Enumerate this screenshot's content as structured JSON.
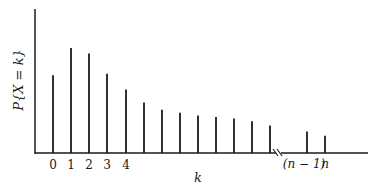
{
  "chart_data": {
    "type": "bar",
    "subtype": "stem",
    "title": "",
    "xlabel": "k",
    "ylabel": "P{X = k}",
    "categories": [
      "0",
      "1",
      "2",
      "3",
      "4",
      "5",
      "6",
      "7",
      "8",
      "9",
      "10",
      "11",
      "12",
      "(n − 1)",
      "n"
    ],
    "tick_labels_shown": [
      "0",
      "1",
      "2",
      "3",
      "4",
      "(n − 1)",
      "n"
    ],
    "values": [
      0.54,
      0.73,
      0.69,
      0.55,
      0.44,
      0.35,
      0.3,
      0.28,
      0.26,
      0.25,
      0.24,
      0.22,
      0.19,
      0.15,
      0.12
    ],
    "axis_break_after": "12",
    "yticks": "none",
    "grid": false,
    "legend": null,
    "ylim": [
      0,
      1
    ]
  },
  "labels": {
    "xlabel": "k",
    "ylabel": "P{X = k}",
    "tick_0": "0",
    "tick_1": "1",
    "tick_2": "2",
    "tick_3": "3",
    "tick_4": "4",
    "tick_nm1": "(n − 1)",
    "tick_n": "n"
  },
  "colors": {
    "ink": "#1a1a1a",
    "background": "#ffffff"
  }
}
